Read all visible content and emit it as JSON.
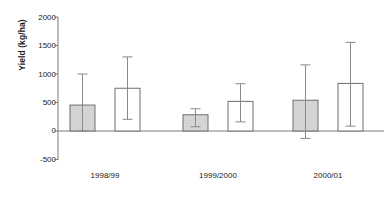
{
  "chart_data": {
    "type": "bar",
    "title": "",
    "xlabel": "Cotton growing season",
    "ylabel": "Yield (kg/ha)",
    "categories": [
      "1998/99",
      "1999/2000",
      "2000/01"
    ],
    "yticks": [
      2000,
      1500,
      1000,
      500,
      0,
      -500
    ],
    "ylim": [
      -500,
      2000
    ],
    "grid": false,
    "legend": "none",
    "orientation": "vertical",
    "error_bars": "whisker-caps-top-and-bottom",
    "series": [
      {
        "name": "shaded-bar",
        "fill": "#d4d4d4",
        "stroke": "#6e6e6e",
        "values": [
          455,
          285,
          540
        ],
        "err_upper": [
          1000,
          390,
          1160
        ],
        "err_lower": [
          0,
          75,
          -130
        ]
      },
      {
        "name": "open-bar",
        "fill": "#ffffff",
        "stroke": "#6e6e6e",
        "values": [
          750,
          520,
          835
        ],
        "err_upper": [
          1300,
          830,
          1555
        ],
        "err_lower": [
          205,
          160,
          85
        ]
      }
    ],
    "colors": {
      "axis": "#7a7a7a",
      "text": "#1a1a1a",
      "shaded_fill": "#d4d4d4",
      "open_fill": "#ffffff",
      "bar_stroke": "#6e6e6e",
      "error_bar": "#8a8a8a"
    }
  }
}
